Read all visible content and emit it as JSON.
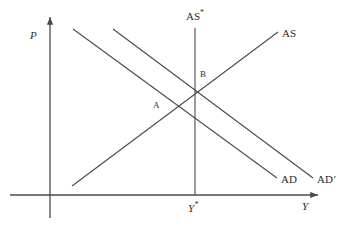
{
  "figure": {
    "type": "economics-as-ad-diagram",
    "background_color": "#ffffff",
    "line_color": "#4a4a4a",
    "text_color": "#2b2b2b"
  },
  "axes": {
    "vertical": {
      "label": "P",
      "name": "price-level-axis",
      "x": 50,
      "y_top": 15,
      "y_bottom": 218,
      "label_x": 30,
      "label_y": 30
    },
    "horizontal": {
      "label": "Y",
      "name": "output-axis",
      "y": 195,
      "x_left": 10,
      "x_right": 321,
      "label_x": 302,
      "label_y": 201
    }
  },
  "curves": [
    {
      "id": "ad",
      "label": "AD",
      "name": "aggregate-demand-curve",
      "x1": 73,
      "y1": 29,
      "x2": 277,
      "y2": 178,
      "label_x": 281,
      "label_y": 174
    },
    {
      "id": "ad_prime",
      "label": "AD",
      "label_suffix": "′",
      "name": "aggregate-demand-shifted-curve",
      "x1": 113,
      "y1": 29,
      "x2": 313,
      "y2": 178,
      "label_x": 317,
      "label_y": 174
    },
    {
      "id": "as",
      "label": "AS",
      "name": "short-run-aggregate-supply-curve",
      "x1": 72,
      "y1": 186,
      "x2": 278,
      "y2": 32,
      "label_x": 282,
      "label_y": 28
    },
    {
      "id": "as_star",
      "label": "AS",
      "label_suffix": "*",
      "name": "long-run-aggregate-supply-curve",
      "x1": 195,
      "y1": 28,
      "x2": 195,
      "y2": 195,
      "label_x": 186,
      "label_y": 9
    }
  ],
  "points": [
    {
      "id": "a",
      "label": "A",
      "name": "equilibrium-point-a",
      "x": 175,
      "y": 110,
      "label_x": 153,
      "label_y": 101
    },
    {
      "id": "b",
      "label": "B",
      "name": "equilibrium-point-b",
      "x": 195,
      "y": 92,
      "label_x": 200,
      "label_y": 70
    }
  ],
  "ticks": [
    {
      "id": "y_star",
      "label": "Y",
      "label_suffix": "*",
      "name": "potential-output-tick-label",
      "x": 188,
      "y": 201
    }
  ]
}
